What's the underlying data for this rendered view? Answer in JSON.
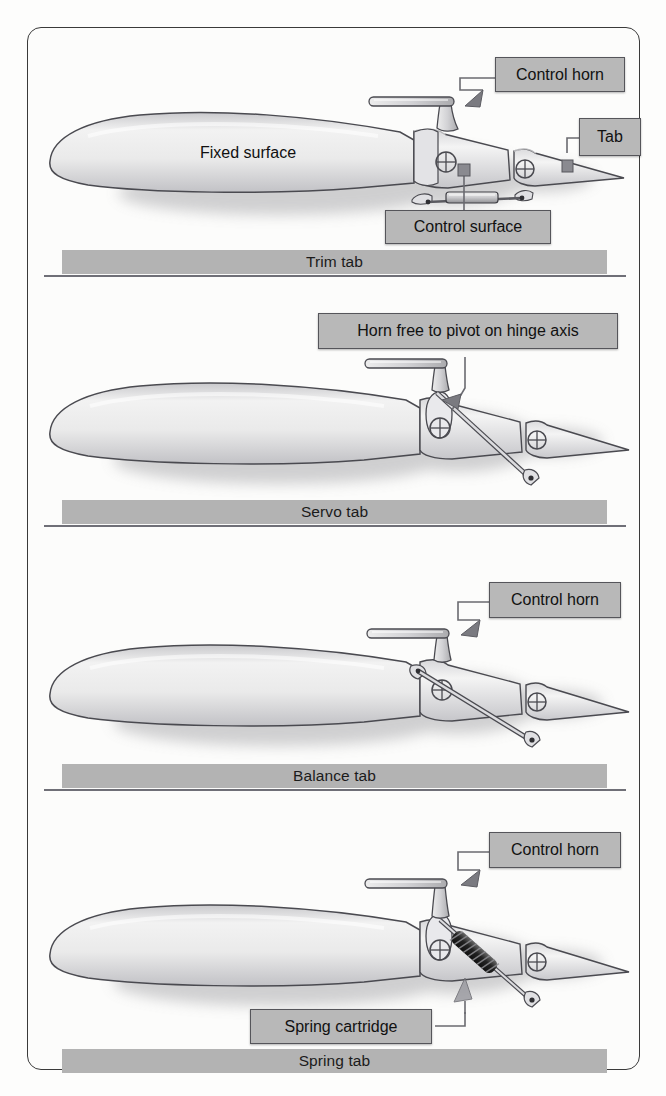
{
  "figure": {
    "type": "technical-illustration",
    "panel_count": 4
  },
  "panels": [
    {
      "id": "trim-tab",
      "caption": "Trim tab",
      "labels": [
        {
          "id": "control-horn",
          "text": "Control horn"
        },
        {
          "id": "tab",
          "text": "Tab"
        },
        {
          "id": "fixed-surface",
          "text": "Fixed surface"
        },
        {
          "id": "control-surface",
          "text": "Control surface"
        }
      ]
    },
    {
      "id": "servo-tab",
      "caption": "Servo tab",
      "labels": [
        {
          "id": "horn-pivot",
          "text": "Horn free to pivot on hinge axis"
        }
      ]
    },
    {
      "id": "balance-tab",
      "caption": "Balance tab",
      "labels": [
        {
          "id": "control-horn",
          "text": "Control horn"
        }
      ]
    },
    {
      "id": "spring-tab",
      "caption": "Spring tab",
      "labels": [
        {
          "id": "control-horn",
          "text": "Control horn"
        },
        {
          "id": "spring-cartridge",
          "text": "Spring cartridge"
        }
      ]
    }
  ],
  "colors": {
    "frame_border": "#3a3a3a",
    "caption_bar": "#b3b3b3",
    "caption_rule": "#6f6f77",
    "label_fill": "#b8b8b8",
    "label_border": "#55555a",
    "airfoil_outline": "#4a4a50",
    "airfoil_light": "#fbfbfb",
    "airfoil_mid": "#d9d9da",
    "airfoil_dark": "#a9a9ad",
    "spring_dark": "#2a2a2a",
    "leader_line": "#6a6a70",
    "page_background": "#ffffff"
  },
  "icons": {
    "hinge": "hinge-crosshair-icon",
    "arrow": "leader-arrow-icon",
    "spring": "spring-coil-icon",
    "turnbuckle": "turnbuckle-icon"
  }
}
